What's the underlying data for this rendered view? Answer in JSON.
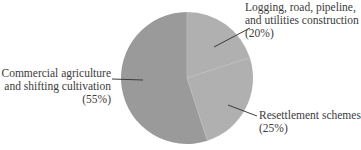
{
  "chart_data": {
    "type": "pie",
    "title": "",
    "start_angle_deg": 0,
    "direction": "clockwise",
    "slices": [
      {
        "label": "Logging, road, pipeline, and utilities construction",
        "value": 20,
        "pct_label": "(20%)",
        "color": "#b0b0b0"
      },
      {
        "label": "Resettlement schemes",
        "value": 25,
        "pct_label": "(25%)",
        "color": "#b0b0b0"
      },
      {
        "label": "Commercial agriculture and shifting cultivation",
        "value": 55,
        "pct_label": "(55%)",
        "color": "#9a9a9a"
      }
    ],
    "legend": "none (leader-line labels)"
  },
  "labels": {
    "logging": {
      "line1": "Logging, road, pipeline,",
      "line2": "and utilities construction",
      "pct": "(20%)"
    },
    "resettlement": {
      "line1": "Resettlement schemes",
      "pct": "(25%)"
    },
    "commercial": {
      "line1": "Commercial agriculture",
      "line2": "and shifting cultivation",
      "pct": "(55%)"
    }
  }
}
